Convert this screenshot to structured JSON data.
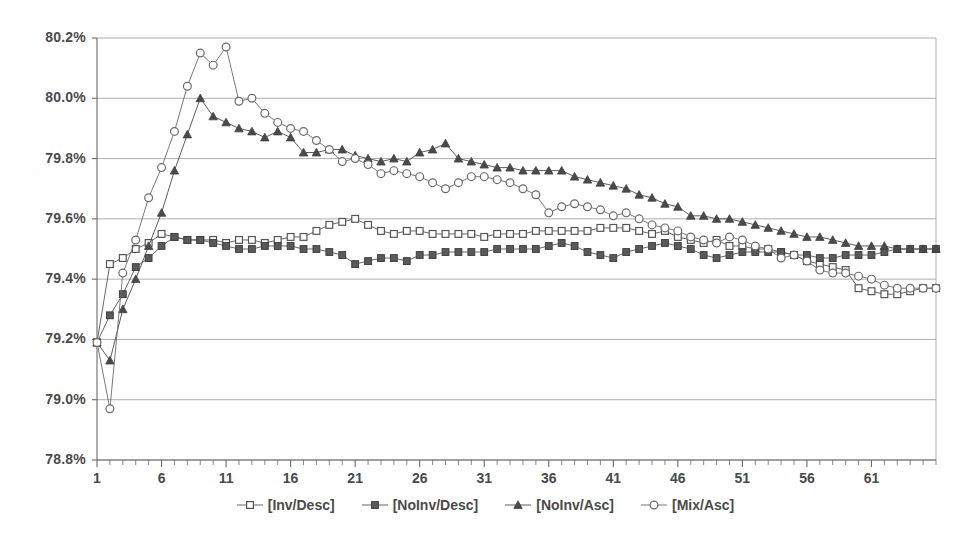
{
  "chart_data": {
    "type": "line",
    "title": "",
    "xlabel": "",
    "ylabel": "",
    "grid": true,
    "legend_position": "bottom",
    "ylim": [
      78.8,
      80.2
    ],
    "ytick_labels": [
      "80.2%",
      "80.0%",
      "79.8%",
      "79.6%",
      "79.4%",
      "79.2%",
      "79.0%",
      "78.8%"
    ],
    "ytick_values": [
      80.2,
      80.0,
      79.8,
      79.6,
      79.4,
      79.2,
      79.0,
      78.8
    ],
    "xlim": [
      1,
      66
    ],
    "xtick_labels": [
      "1",
      "6",
      "11",
      "16",
      "21",
      "26",
      "31",
      "36",
      "41",
      "46",
      "51",
      "56",
      "61"
    ],
    "xtick_values": [
      1,
      6,
      11,
      16,
      21,
      26,
      31,
      36,
      41,
      46,
      51,
      56,
      61
    ],
    "x": [
      1,
      2,
      3,
      4,
      5,
      6,
      7,
      8,
      9,
      10,
      11,
      12,
      13,
      14,
      15,
      16,
      17,
      18,
      19,
      20,
      21,
      22,
      23,
      24,
      25,
      26,
      27,
      28,
      29,
      30,
      31,
      32,
      33,
      34,
      35,
      36,
      37,
      38,
      39,
      40,
      41,
      42,
      43,
      44,
      45,
      46,
      47,
      48,
      49,
      50,
      51,
      52,
      53,
      54,
      55,
      56,
      57,
      58,
      59,
      60,
      61,
      62,
      63,
      64,
      65,
      66
    ],
    "series": [
      {
        "name": "[Inv/Desc]",
        "marker": "open-square",
        "color": "#555555",
        "values": [
          79.19,
          79.45,
          79.47,
          79.5,
          79.52,
          79.55,
          79.54,
          79.53,
          79.53,
          79.53,
          79.52,
          79.53,
          79.53,
          79.52,
          79.53,
          79.54,
          79.54,
          79.56,
          79.58,
          79.59,
          79.6,
          79.58,
          79.56,
          79.55,
          79.56,
          79.56,
          79.55,
          79.55,
          79.55,
          79.55,
          79.54,
          79.55,
          79.55,
          79.55,
          79.56,
          79.56,
          79.56,
          79.56,
          79.56,
          79.57,
          79.57,
          79.57,
          79.56,
          79.55,
          79.56,
          79.54,
          79.53,
          79.52,
          79.53,
          79.51,
          79.51,
          79.5,
          79.5,
          79.49,
          79.48,
          79.46,
          79.45,
          79.44,
          79.43,
          79.37,
          79.36,
          79.35,
          79.35,
          79.36,
          79.37,
          79.37
        ]
      },
      {
        "name": "[NoInv/Desc]",
        "marker": "filled-square",
        "color": "#555555",
        "values": [
          79.19,
          79.28,
          79.35,
          79.44,
          79.47,
          79.51,
          79.54,
          79.53,
          79.53,
          79.52,
          79.51,
          79.5,
          79.5,
          79.51,
          79.51,
          79.51,
          79.5,
          79.5,
          79.49,
          79.48,
          79.45,
          79.46,
          79.47,
          79.47,
          79.46,
          79.48,
          79.48,
          79.49,
          79.49,
          79.49,
          79.49,
          79.5,
          79.5,
          79.5,
          79.5,
          79.51,
          79.52,
          79.51,
          79.49,
          79.48,
          79.47,
          79.49,
          79.5,
          79.51,
          79.52,
          79.51,
          79.5,
          79.48,
          79.47,
          79.48,
          79.49,
          79.49,
          79.49,
          79.49,
          79.48,
          79.48,
          79.47,
          79.47,
          79.48,
          79.48,
          79.48,
          79.49,
          79.5,
          79.5,
          79.5,
          79.5
        ]
      },
      {
        "name": "[NoInv/Asc]",
        "marker": "filled-triangle",
        "color": "#4a4a4a",
        "values": [
          79.19,
          79.13,
          79.3,
          79.4,
          79.51,
          79.62,
          79.76,
          79.88,
          80.0,
          79.94,
          79.92,
          79.9,
          79.89,
          79.87,
          79.89,
          79.87,
          79.82,
          79.82,
          79.83,
          79.83,
          79.81,
          79.8,
          79.79,
          79.8,
          79.79,
          79.82,
          79.83,
          79.85,
          79.8,
          79.79,
          79.78,
          79.77,
          79.77,
          79.76,
          79.76,
          79.76,
          79.76,
          79.74,
          79.73,
          79.72,
          79.71,
          79.7,
          79.68,
          79.67,
          79.65,
          79.64,
          79.61,
          79.61,
          79.6,
          79.6,
          79.59,
          79.58,
          79.57,
          79.56,
          79.55,
          79.54,
          79.54,
          79.53,
          79.52,
          79.51,
          79.51,
          79.51,
          79.5,
          79.5,
          79.5,
          79.5
        ]
      },
      {
        "name": "[Mix/Asc]",
        "marker": "open-circle",
        "color": "#6a6a6a",
        "values": [
          79.19,
          78.97,
          79.42,
          79.53,
          79.67,
          79.77,
          79.89,
          80.04,
          80.15,
          80.11,
          80.17,
          79.99,
          80.0,
          79.95,
          79.92,
          79.9,
          79.89,
          79.86,
          79.83,
          79.79,
          79.8,
          79.78,
          79.75,
          79.76,
          79.75,
          79.74,
          79.72,
          79.7,
          79.72,
          79.74,
          79.74,
          79.73,
          79.72,
          79.7,
          79.68,
          79.62,
          79.64,
          79.65,
          79.64,
          79.63,
          79.61,
          79.62,
          79.6,
          79.58,
          79.57,
          79.56,
          79.54,
          79.53,
          79.52,
          79.54,
          79.53,
          79.51,
          79.5,
          79.47,
          79.48,
          79.46,
          79.43,
          79.42,
          79.42,
          79.41,
          79.4,
          79.38,
          79.37,
          79.37,
          79.37,
          79.37
        ]
      }
    ]
  },
  "axes": {
    "plot_left": 97,
    "plot_right": 936,
    "plot_top": 38,
    "plot_bottom": 460
  }
}
